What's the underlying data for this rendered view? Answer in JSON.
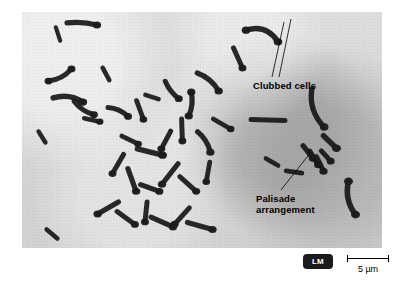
{
  "figure": {
    "type": "light-micrograph",
    "background_color": "#ffffff",
    "plate_color": "#d9d9d9",
    "cell_color": "#1a1a1a"
  },
  "annotations": [
    {
      "id": "clubbed-cells",
      "label": "Clubbed cells",
      "leader_lines": 2
    },
    {
      "id": "palisade-arrangement",
      "label": "Palisade\narrangement",
      "leader_lines": 1
    }
  ],
  "footer": {
    "microscopy_badge": "LM",
    "badge_color": "#1b1b1b",
    "badge_text_color": "#ffffff",
    "scale_label": "5 µm"
  },
  "cells": [
    {
      "x": 38,
      "y": 63,
      "len": 26,
      "w": 5.0,
      "rot": -28,
      "curve": 10,
      "bulb": "both"
    },
    {
      "x": 46,
      "y": 88,
      "len": 30,
      "w": 5.4,
      "rot": 8,
      "curve": -14,
      "bulb": "end"
    },
    {
      "x": 62,
      "y": 96,
      "len": 24,
      "w": 5.0,
      "rot": 34,
      "curve": 8,
      "bulb": "end"
    },
    {
      "x": 36,
      "y": 22,
      "len": 14,
      "w": 4.2,
      "rot": 72,
      "curve": 0,
      "bulb": "none"
    },
    {
      "x": 60,
      "y": 12,
      "len": 30,
      "w": 5.2,
      "rot": 4,
      "curve": -6,
      "bulb": "end"
    },
    {
      "x": 84,
      "y": 62,
      "len": 14,
      "w": 4.6,
      "rot": 62,
      "curve": 0,
      "bulb": "none"
    },
    {
      "x": 20,
      "y": 125,
      "len": 13,
      "w": 4.4,
      "rot": 58,
      "curve": 0,
      "bulb": "none"
    },
    {
      "x": 70,
      "y": 108,
      "len": 16,
      "w": 4.6,
      "rot": 12,
      "curve": 0,
      "bulb": "end"
    },
    {
      "x": 96,
      "y": 100,
      "len": 22,
      "w": 5.0,
      "rot": 24,
      "curve": -8,
      "bulb": "end"
    },
    {
      "x": 118,
      "y": 98,
      "len": 20,
      "w": 4.8,
      "rot": 70,
      "curve": 0,
      "bulb": "end"
    },
    {
      "x": 130,
      "y": 85,
      "len": 14,
      "w": 4.4,
      "rot": 18,
      "curve": 0,
      "bulb": "none"
    },
    {
      "x": 150,
      "y": 78,
      "len": 22,
      "w": 5.0,
      "rot": 52,
      "curve": 6,
      "bulb": "end"
    },
    {
      "x": 168,
      "y": 92,
      "len": 24,
      "w": 5.2,
      "rot": 96,
      "curve": -8,
      "bulb": "both"
    },
    {
      "x": 186,
      "y": 70,
      "len": 28,
      "w": 5.2,
      "rot": 40,
      "curve": -10,
      "bulb": "end"
    },
    {
      "x": 108,
      "y": 128,
      "len": 18,
      "w": 4.8,
      "rot": 26,
      "curve": 0,
      "bulb": "end"
    },
    {
      "x": 128,
      "y": 140,
      "len": 26,
      "w": 5.4,
      "rot": 14,
      "curve": 0,
      "bulb": "end"
    },
    {
      "x": 144,
      "y": 128,
      "len": 20,
      "w": 5.0,
      "rot": 118,
      "curve": 0,
      "bulb": "end"
    },
    {
      "x": 160,
      "y": 118,
      "len": 22,
      "w": 5.0,
      "rot": 88,
      "curve": 0,
      "bulb": "end"
    },
    {
      "x": 182,
      "y": 130,
      "len": 24,
      "w": 5.2,
      "rot": 58,
      "curve": -8,
      "bulb": "end"
    },
    {
      "x": 200,
      "y": 112,
      "len": 20,
      "w": 4.8,
      "rot": 30,
      "curve": 0,
      "bulb": "end"
    },
    {
      "x": 96,
      "y": 152,
      "len": 22,
      "w": 5.0,
      "rot": 120,
      "curve": 0,
      "bulb": "end"
    },
    {
      "x": 110,
      "y": 168,
      "len": 24,
      "w": 5.2,
      "rot": 70,
      "curve": 0,
      "bulb": "end"
    },
    {
      "x": 128,
      "y": 176,
      "len": 20,
      "w": 5.0,
      "rot": 20,
      "curve": 0,
      "bulb": "end"
    },
    {
      "x": 148,
      "y": 162,
      "len": 26,
      "w": 5.2,
      "rot": 128,
      "curve": 0,
      "bulb": "end"
    },
    {
      "x": 166,
      "y": 172,
      "len": 22,
      "w": 5.0,
      "rot": 42,
      "curve": 0,
      "bulb": "end"
    },
    {
      "x": 186,
      "y": 160,
      "len": 20,
      "w": 4.8,
      "rot": 100,
      "curve": 0,
      "bulb": "end"
    },
    {
      "x": 86,
      "y": 196,
      "len": 24,
      "w": 5.2,
      "rot": 150,
      "curve": 0,
      "bulb": "end"
    },
    {
      "x": 104,
      "y": 206,
      "len": 22,
      "w": 5.0,
      "rot": 36,
      "curve": 0,
      "bulb": "end"
    },
    {
      "x": 124,
      "y": 200,
      "len": 20,
      "w": 5.0,
      "rot": 96,
      "curve": 0,
      "bulb": "end"
    },
    {
      "x": 140,
      "y": 210,
      "len": 24,
      "w": 5.2,
      "rot": 24,
      "curve": 0,
      "bulb": "end"
    },
    {
      "x": 160,
      "y": 204,
      "len": 22,
      "w": 5.0,
      "rot": 132,
      "curve": 0,
      "bulb": "end"
    },
    {
      "x": 178,
      "y": 214,
      "len": 26,
      "w": 5.2,
      "rot": 16,
      "curve": 0,
      "bulb": "end"
    },
    {
      "x": 30,
      "y": 222,
      "len": 14,
      "w": 4.6,
      "rot": 40,
      "curve": 0,
      "bulb": "none"
    },
    {
      "x": 216,
      "y": 46,
      "len": 22,
      "w": 5.0,
      "rot": 66,
      "curve": 0,
      "bulb": "end"
    },
    {
      "x": 240,
      "y": 24,
      "len": 34,
      "w": 5.4,
      "rot": 20,
      "curve": -26,
      "bulb": "both"
    },
    {
      "x": 246,
      "y": 108,
      "len": 34,
      "w": 5.0,
      "rot": 2,
      "curve": 0,
      "bulb": "none"
    },
    {
      "x": 296,
      "y": 96,
      "len": 40,
      "w": 5.4,
      "rot": 72,
      "curve": 20,
      "bulb": "end"
    },
    {
      "x": 308,
      "y": 130,
      "len": 18,
      "w": 5.6,
      "rot": 44,
      "curve": 0,
      "bulb": "end"
    },
    {
      "x": 250,
      "y": 150,
      "len": 14,
      "w": 4.6,
      "rot": 30,
      "curve": 0,
      "bulb": "none"
    },
    {
      "x": 272,
      "y": 160,
      "len": 16,
      "w": 4.6,
      "rot": 8,
      "curve": 0,
      "bulb": "none"
    },
    {
      "x": 330,
      "y": 186,
      "len": 34,
      "w": 5.6,
      "rot": 78,
      "curve": 16,
      "bulb": "both"
    },
    {
      "x": 286,
      "y": 140,
      "len": 16,
      "w": 5.2,
      "rot": 52,
      "curve": 0,
      "bulb": "end"
    },
    {
      "x": 292,
      "y": 146,
      "len": 16,
      "w": 5.2,
      "rot": 58,
      "curve": 0,
      "bulb": "end"
    },
    {
      "x": 298,
      "y": 152,
      "len": 16,
      "w": 5.2,
      "rot": 64,
      "curve": 0,
      "bulb": "end"
    },
    {
      "x": 304,
      "y": 144,
      "len": 14,
      "w": 5.0,
      "rot": 48,
      "curve": 0,
      "bulb": "end"
    }
  ]
}
